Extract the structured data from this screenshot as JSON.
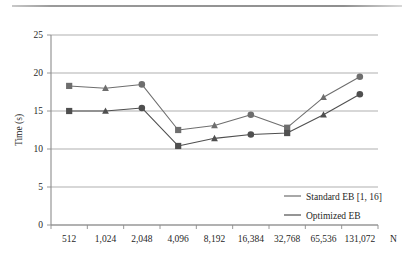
{
  "chart_data": {
    "type": "line",
    "title": "",
    "subtitle": "",
    "xlabel": "N",
    "ylabel": "Time (s)",
    "categories": [
      "512",
      "1,024",
      "2,048",
      "4,096",
      "8,192",
      "16,384",
      "32,768",
      "65,536",
      "131,072"
    ],
    "ytick_labels": [
      "0",
      "5",
      "10",
      "15",
      "20",
      "25"
    ],
    "yticks": [
      0,
      5,
      10,
      15,
      20,
      25
    ],
    "ylim": [
      0,
      25
    ],
    "grid": "horizontal",
    "legend_position": "bottom-right",
    "series": [
      {
        "name": "Standard EB [1, 16]",
        "color": "#6e6e6e",
        "marker": "square-triangle-circle",
        "values": [
          18.3,
          18.0,
          18.5,
          12.5,
          13.1,
          14.5,
          12.8,
          16.8,
          19.5
        ],
        "markers": [
          "square",
          "triangle",
          "circle",
          "square",
          "triangle",
          "circle",
          "square",
          "triangle",
          "circle"
        ]
      },
      {
        "name": "Optimized EB",
        "color": "#4f4f4f",
        "marker": "square-triangle-circle",
        "values": [
          15.0,
          15.0,
          15.4,
          10.4,
          11.4,
          11.9,
          12.1,
          14.5,
          17.2
        ],
        "markers": [
          "square",
          "triangle",
          "circle",
          "square",
          "triangle",
          "circle",
          "square",
          "triangle",
          "circle"
        ]
      }
    ]
  },
  "legend": {
    "entries": [
      {
        "label": "Standard EB [1, 16]"
      },
      {
        "label": "Optimized EB"
      }
    ]
  },
  "axes": {
    "y_title": "Time (s)",
    "x_unit_label": "N"
  }
}
